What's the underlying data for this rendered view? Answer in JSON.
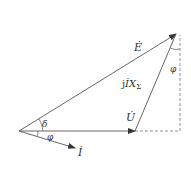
{
  "diagram": {
    "type": "phasor-diagram",
    "line_color": "#555555",
    "dash_color": "#777777",
    "background": "#ffffff",
    "vectors": {
      "E": {
        "label": "Ė",
        "from": [
          19,
          131
        ],
        "to": [
          176,
          34
        ]
      },
      "U": {
        "label": "U̇",
        "from": [
          19,
          131
        ],
        "to": [
          135,
          131
        ]
      },
      "I": {
        "label": "İ",
        "from": [
          19,
          131
        ],
        "to": [
          75,
          148
        ]
      },
      "jIX": {
        "label_prefix": "j",
        "label_main": "İX",
        "label_sub": "Σ",
        "from": [
          135,
          131
        ],
        "to": [
          176,
          34
        ]
      }
    },
    "angles": {
      "delta": {
        "label": "δ"
      },
      "phi_origin": {
        "label": "φ"
      },
      "phi_top": {
        "label": "φ"
      }
    },
    "dashed_projection": {
      "horizontal": {
        "from": [
          135,
          131
        ],
        "to": [
          180,
          131
        ]
      },
      "vertical": {
        "from": [
          180,
          131
        ],
        "to": [
          180,
          34
        ]
      }
    }
  }
}
